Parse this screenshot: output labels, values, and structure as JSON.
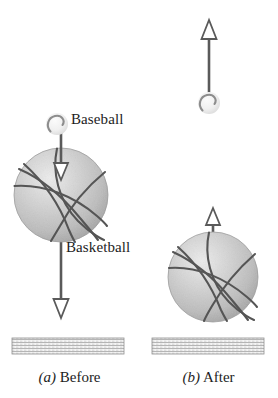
{
  "figure": {
    "kind": "physics-diagram",
    "background_color": "#ffffff"
  },
  "colors": {
    "ball_fill_light": "#e8e8e8",
    "ball_fill_mid": "#c9c9c9",
    "ball_fill_dark": "#a8a8a8",
    "seam_stroke": "#5a5a5a",
    "arrow_stroke": "#5a5a5a",
    "ground_fill": "#f2f2f2",
    "ground_hatch": "#9a9a9a",
    "ground_border": "#8a8a8a",
    "text": "#1d1d1d",
    "baseball_fill": "#f4f4f4",
    "baseball_seam": "#8d8d8d"
  },
  "panels": [
    {
      "id": "before",
      "enumerator": "(a)",
      "caption": "Before",
      "objects": {
        "baseball": {
          "name": "Baseball",
          "label": "Baseball",
          "cx": 57,
          "cy": 124,
          "r": 11
        },
        "basketball": {
          "name": "Basketball",
          "label": "Basketball",
          "cx": 61,
          "cy": 195,
          "r": 47
        },
        "arrow_upper": {
          "direction": "down",
          "x": 61,
          "y_start": 126,
          "y_end": 180,
          "head": "open-triangle"
        },
        "arrow_lower": {
          "direction": "down",
          "x": 61,
          "y_start": 242,
          "y_end": 318,
          "head": "open-triangle"
        },
        "ground": {
          "x": 12,
          "y": 338,
          "width": 112,
          "height": 16
        }
      }
    },
    {
      "id": "after",
      "enumerator": "(b)",
      "caption": "After",
      "objects": {
        "baseball": {
          "name": "Baseball",
          "cx": 209,
          "cy": 103,
          "r": 11
        },
        "basketball": {
          "name": "Basketball",
          "cx": 213,
          "cy": 277,
          "r": 45
        },
        "arrow_upper": {
          "direction": "up",
          "x": 209,
          "y_start": 101,
          "y_end": 20,
          "head": "open-triangle"
        },
        "arrow_lower": {
          "direction": "up",
          "x": 213,
          "y_start": 240,
          "y_end": 208,
          "head": "open-triangle"
        },
        "ground": {
          "x": 152,
          "y": 338,
          "width": 112,
          "height": 16
        }
      }
    }
  ]
}
